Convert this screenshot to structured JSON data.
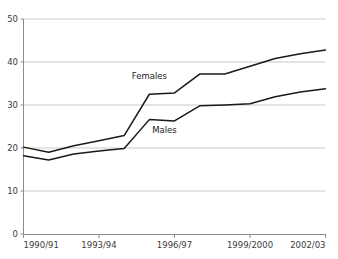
{
  "chart_data": {
    "type": "line",
    "title": "",
    "subtitle": "",
    "xlabel": "",
    "ylabel": "",
    "x": [
      "1990/91",
      "1991/92",
      "1992/93",
      "1993/94",
      "1994/95",
      "1995/96",
      "1996/97",
      "1997/98",
      "1998/99",
      "1999/2000",
      "2000/01",
      "2001/02",
      "2002/03"
    ],
    "categories": [
      "1990/91",
      "1991/92",
      "1992/93",
      "1993/94",
      "1994/95",
      "1995/96",
      "1996/97",
      "1997/98",
      "1998/99",
      "1999/2000",
      "2000/01",
      "2001/02",
      "2002/03"
    ],
    "series": [
      {
        "name": "Females",
        "values": [
          20.2,
          19.0,
          20.5,
          21.7,
          22.9,
          32.5,
          32.8,
          37.2,
          37.2,
          39.0,
          40.8,
          41.9,
          42.8
        ],
        "color": "#1a1a1a"
      },
      {
        "name": "Males",
        "values": [
          18.2,
          17.2,
          18.6,
          19.3,
          19.9,
          26.6,
          26.3,
          29.8,
          30.0,
          30.3,
          31.9,
          33.0,
          33.8
        ],
        "color": "#1a1a1a"
      }
    ],
    "xtick_labels": [
      "1990/91",
      "1993/94",
      "1996/97",
      "1999/2000",
      "2002/03"
    ],
    "xtick_indices": [
      0,
      3,
      6,
      9,
      12
    ],
    "ytick_labels": [
      "0",
      "10",
      "20",
      "30",
      "40",
      "50"
    ],
    "yticks": [
      0,
      10,
      20,
      30,
      40,
      50
    ],
    "ylim": [
      0,
      50
    ],
    "grid": "horizontal",
    "legend": "inline-annotations",
    "annotations": [
      {
        "text": "Females",
        "x_value": 5.0,
        "y_value": 36.0
      },
      {
        "text": "Males",
        "x_value": 5.6,
        "y_value": 23.6
      }
    ],
    "colors": {
      "line": "#1a1a1a",
      "grid": "#c8c8c8",
      "axis": "#8c8c8c",
      "tick_text": "#3b3b3b",
      "background": "#ffffff"
    }
  }
}
